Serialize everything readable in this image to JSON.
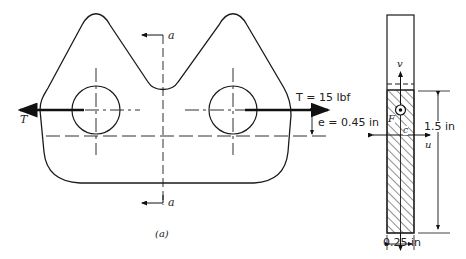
{
  "figure": {
    "caption": "(a)",
    "load": {
      "symbol": "T",
      "right_label": "T = 15 lbf",
      "left_label": "T"
    },
    "eccentricity": {
      "label": "e = 0.45 in"
    },
    "section": {
      "marker": "a",
      "marker_bottom": "a"
    },
    "cross_section": {
      "axis_v": "v",
      "axis_u": "u",
      "point_F": "F",
      "point_c": "c",
      "height_label": "1.5 in",
      "width_label": "0.25 in"
    }
  },
  "colors": {
    "line": "#1a1a1a",
    "background": "#ffffff"
  }
}
